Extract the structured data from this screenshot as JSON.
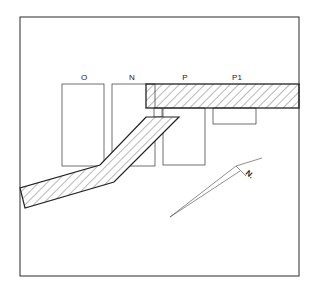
{
  "diagram": {
    "type": "site-plan",
    "labels": {
      "building_o": "O",
      "building_n": "N",
      "building_p": "P",
      "building_p1": "P1"
    },
    "north_arrow": {
      "label": "N."
    },
    "colors": {
      "line": "#2a2a2a",
      "background": "#ffffff",
      "hatch": "#333333"
    }
  }
}
